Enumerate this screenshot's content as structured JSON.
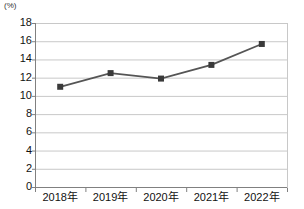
{
  "chart_data": {
    "type": "line",
    "title": "",
    "subtitle": "",
    "xlabel": "",
    "ylabel": "",
    "unit_label": "(%)",
    "categories": [
      "2018年",
      "2019年",
      "2020年",
      "2021年",
      "2022年"
    ],
    "values": [
      11.0,
      12.5,
      11.9,
      13.4,
      15.7
    ],
    "series": [
      {
        "name": "",
        "values": [
          11.0,
          12.5,
          11.9,
          13.4,
          15.7
        ]
      }
    ],
    "ylim": [
      0,
      18
    ],
    "ytick_labels": [
      "18",
      "16",
      "14",
      "12",
      "10",
      "8",
      "6",
      "4",
      "2",
      "0"
    ],
    "ytick_values": [
      18,
      16,
      14,
      12,
      10,
      8,
      6,
      4,
      2,
      0
    ],
    "ystep": 2,
    "grid": true,
    "grid_axis": "y",
    "legend": false,
    "legend_position": "none",
    "line_color": "#555555",
    "marker_color": "#3a3a3a",
    "marker_shape": "square",
    "grid_color": "#c8c8c8",
    "axis_color": "#808080",
    "background_color": "#ffffff",
    "annotations": []
  }
}
